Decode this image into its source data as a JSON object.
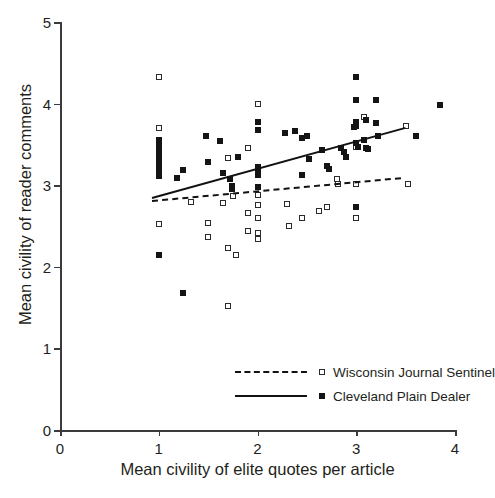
{
  "chart_data": {
    "type": "scatter",
    "title": "",
    "xlabel": "Mean civility of elite quotes per article",
    "ylabel": "Mean civility of reader comments",
    "xlim": [
      0,
      4
    ],
    "ylim": [
      0,
      5
    ],
    "xticks": [
      0,
      1,
      2,
      3,
      4
    ],
    "yticks": [
      0,
      1,
      2,
      3,
      4,
      5
    ],
    "xtick_labels": [
      "0",
      "1",
      "2",
      "3",
      "4"
    ],
    "ytick_labels": [
      "0",
      "1",
      "2",
      "3",
      "4",
      "5"
    ],
    "grid": false,
    "legend_position": "lower right",
    "series": [
      {
        "name": "Wisconsin Journal Sentinel",
        "marker": "open-square",
        "line_style": "dashed",
        "trend_line": {
          "x0": 0.93,
          "y0": 2.82,
          "x1": 3.45,
          "y1": 3.1
        },
        "points": [
          [
            1.0,
            4.33
          ],
          [
            1.0,
            3.7
          ],
          [
            1.0,
            2.53
          ],
          [
            1.33,
            2.8
          ],
          [
            1.5,
            2.54
          ],
          [
            1.5,
            2.37
          ],
          [
            1.65,
            2.78
          ],
          [
            1.7,
            3.33
          ],
          [
            1.7,
            2.23
          ],
          [
            1.7,
            1.52
          ],
          [
            1.75,
            2.87
          ],
          [
            1.78,
            2.14
          ],
          [
            1.9,
            3.45
          ],
          [
            1.9,
            2.66
          ],
          [
            1.9,
            2.44
          ],
          [
            2.0,
            4.0
          ],
          [
            2.0,
            3.14
          ],
          [
            2.0,
            2.88
          ],
          [
            2.0,
            2.76
          ],
          [
            2.0,
            2.6
          ],
          [
            2.0,
            2.41
          ],
          [
            2.0,
            2.34
          ],
          [
            2.3,
            2.77
          ],
          [
            2.32,
            2.5
          ],
          [
            2.45,
            2.6
          ],
          [
            2.62,
            2.68
          ],
          [
            2.7,
            2.73
          ],
          [
            2.8,
            3.08
          ],
          [
            2.82,
            3.02
          ],
          [
            3.0,
            3.73
          ],
          [
            3.0,
            3.47
          ],
          [
            3.0,
            3.01
          ],
          [
            3.0,
            2.6
          ],
          [
            3.08,
            3.83
          ],
          [
            3.5,
            3.72
          ],
          [
            3.52,
            3.01
          ]
        ]
      },
      {
        "name": "Cleveland Plain Dealer",
        "marker": "filled-square",
        "line_style": "solid",
        "trend_line": {
          "x0": 0.93,
          "y0": 2.85,
          "x1": 3.5,
          "y1": 3.71
        },
        "points": [
          [
            1.0,
            3.55
          ],
          [
            1.0,
            3.5
          ],
          [
            1.0,
            3.45
          ],
          [
            1.0,
            3.41
          ],
          [
            1.0,
            3.36
          ],
          [
            1.0,
            3.31
          ],
          [
            1.0,
            3.25
          ],
          [
            1.0,
            3.18
          ],
          [
            1.0,
            3.11
          ],
          [
            1.0,
            2.15
          ],
          [
            1.18,
            3.09
          ],
          [
            1.25,
            3.19
          ],
          [
            1.25,
            1.68
          ],
          [
            1.48,
            3.6
          ],
          [
            1.5,
            3.29
          ],
          [
            1.62,
            3.54
          ],
          [
            1.65,
            3.15
          ],
          [
            1.72,
            3.08
          ],
          [
            1.74,
            2.99
          ],
          [
            1.74,
            2.95
          ],
          [
            1.8,
            3.35
          ],
          [
            2.0,
            3.77
          ],
          [
            2.0,
            3.68
          ],
          [
            2.0,
            3.22
          ],
          [
            2.0,
            3.17
          ],
          [
            2.0,
            3.12
          ],
          [
            2.0,
            2.98
          ],
          [
            2.28,
            3.64
          ],
          [
            2.38,
            3.66
          ],
          [
            2.45,
            3.58
          ],
          [
            2.5,
            3.6
          ],
          [
            2.45,
            3.12
          ],
          [
            2.52,
            3.32
          ],
          [
            2.65,
            3.43
          ],
          [
            2.7,
            3.23
          ],
          [
            2.72,
            3.2
          ],
          [
            2.85,
            3.45
          ],
          [
            2.88,
            3.41
          ],
          [
            2.9,
            3.35
          ],
          [
            2.98,
            3.71
          ],
          [
            3.0,
            4.33
          ],
          [
            3.0,
            4.05
          ],
          [
            3.0,
            3.77
          ],
          [
            3.0,
            3.72
          ],
          [
            3.0,
            3.52
          ],
          [
            3.02,
            3.47
          ],
          [
            3.0,
            2.73
          ],
          [
            3.08,
            3.55
          ],
          [
            3.1,
            3.8
          ],
          [
            3.1,
            3.46
          ],
          [
            3.12,
            3.44
          ],
          [
            3.2,
            4.05
          ],
          [
            3.2,
            3.76
          ],
          [
            3.22,
            3.6
          ],
          [
            3.6,
            3.6
          ],
          [
            3.85,
            3.98
          ]
        ]
      }
    ]
  },
  "legend": {
    "items": [
      {
        "label": "Wisconsin Journal Sentinel",
        "line_style": "dashed",
        "marker": "open"
      },
      {
        "label": "Cleveland Plain Dealer",
        "line_style": "solid",
        "marker": "filled"
      }
    ]
  }
}
